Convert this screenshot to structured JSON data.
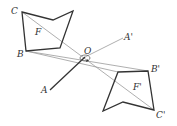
{
  "diagram": {
    "labels": {
      "C": "C",
      "B": "B",
      "F": "F",
      "O": "O",
      "A": "A",
      "A_prime": "A'",
      "B_prime": "B'",
      "C_prime": "C'",
      "F_prime": "F'"
    },
    "colors": {
      "shape": "#333333",
      "ray": "#999999",
      "segment": "#333333"
    }
  }
}
